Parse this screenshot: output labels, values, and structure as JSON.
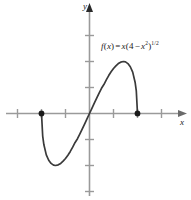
{
  "figure": {
    "caption_formula_plain": "f(x) = x(4 - x^2)^(1/2)",
    "function_label": {
      "f": "f",
      "open_paren": "(",
      "var": "x",
      "close_paren": ")",
      "equals": "=",
      "x_factor": "x",
      "group_open": "(",
      "four": "4",
      "minus": "−",
      "x_inner": "x",
      "exp_two": "2",
      "group_close": ")",
      "exponent": "1/2"
    },
    "axes": {
      "x_label": "x",
      "y_label": "y",
      "axis_color": "#9a9a9a",
      "tick_color": "#9a9a9a",
      "curve_color": "#3a3a3a",
      "point_color": "#1a1a1a",
      "background": "#ffffff"
    }
  },
  "chart_data": {
    "type": "line",
    "title": "",
    "subtitle": "",
    "xlabel": "x",
    "ylabel": "y",
    "formula": "f(x) = x(4 − x²)^(1/2)",
    "xlim": [
      -3,
      3
    ],
    "ylim": [
      -3.5,
      4
    ],
    "xticks": [
      -3,
      -2,
      -1,
      0,
      1,
      2,
      3
    ],
    "yticks": [
      -3,
      -2,
      -1,
      0,
      1,
      2,
      3
    ],
    "grid": false,
    "legend": "none",
    "domain": [
      -2,
      2
    ],
    "endpoints": [
      {
        "x": -2,
        "y": 0,
        "marker": "filled-dot"
      },
      {
        "x": 2,
        "y": 0,
        "marker": "filled-dot"
      }
    ],
    "extrema": [
      {
        "type": "minimum",
        "x": -1.414,
        "y": -2.0
      },
      {
        "type": "maximum",
        "x": 1.414,
        "y": 2.0
      }
    ],
    "x": [
      -2.0,
      -1.95,
      -1.9,
      -1.8,
      -1.7,
      -1.6,
      -1.5,
      -1.414,
      -1.3,
      -1.2,
      -1.1,
      -1.0,
      -0.9,
      -0.8,
      -0.7,
      -0.6,
      -0.5,
      -0.4,
      -0.3,
      -0.2,
      -0.1,
      0.0,
      0.1,
      0.2,
      0.3,
      0.4,
      0.5,
      0.6,
      0.7,
      0.8,
      0.9,
      1.0,
      1.1,
      1.2,
      1.3,
      1.414,
      1.5,
      1.6,
      1.7,
      1.8,
      1.9,
      1.95,
      2.0
    ],
    "y": [
      0.0,
      -0.868,
      -1.203,
      -1.592,
      -1.798,
      -1.92,
      -1.984,
      -2.0,
      -1.974,
      -1.92,
      -1.834,
      -1.732,
      -1.606,
      -1.459,
      -1.294,
      -1.113,
      -0.968,
      -0.784,
      -0.591,
      -0.396,
      -0.199,
      0.0,
      0.199,
      0.396,
      0.591,
      0.784,
      0.968,
      1.113,
      1.294,
      1.459,
      1.606,
      1.732,
      1.834,
      1.92,
      1.974,
      2.0,
      1.984,
      1.92,
      1.798,
      1.592,
      1.203,
      0.868,
      0.0
    ],
    "series": [
      {
        "name": "f(x) = x(4 − x²)^(1/2)",
        "color": "#3a3a3a",
        "linewidth": 1.6,
        "style": "solid"
      }
    ]
  }
}
